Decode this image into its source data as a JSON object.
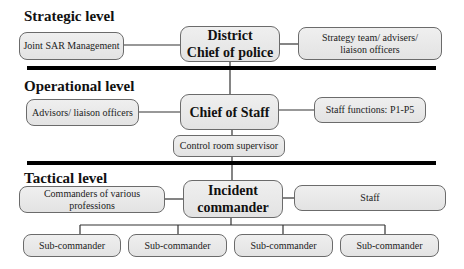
{
  "diagram": {
    "levels": [
      {
        "title": "Strategic level",
        "main": "District\nChief of police",
        "main_line1": "District",
        "main_line2": "Chief of police",
        "left": "Joint SAR Management",
        "right_line1": "Strategy team/ advisers/",
        "right_line2": "liaison officers"
      },
      {
        "title": "Operational level",
        "main": "Chief of Staff",
        "left": "Advisors/ liaison officers",
        "right": "Staff functions: P1-P5",
        "below": "Control room supervisor"
      },
      {
        "title": "Tactical level",
        "main_line1": "Incident",
        "main_line2": "commander",
        "left": "Commanders of various professions",
        "right": "Staff",
        "subordinates": [
          "Sub-commander",
          "Sub-commander",
          "Sub-commander",
          "Sub-commander"
        ]
      }
    ],
    "colors": {
      "box_fill": "#e8e8e8",
      "box_border": "#6b6b6b",
      "separator": "#000000",
      "connector": "#333333"
    }
  }
}
